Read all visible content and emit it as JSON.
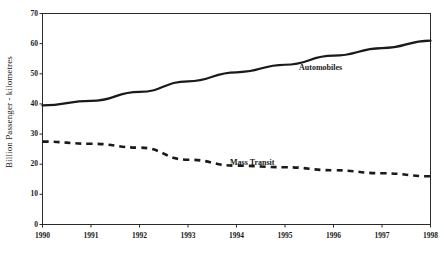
{
  "chart_data": {
    "type": "line",
    "title": "",
    "subtitle": "",
    "xlabel": "",
    "ylabel": "Billion Passenger - kilometres",
    "x": [
      1990,
      1991,
      1992,
      1993,
      1994,
      1995,
      1996,
      1997,
      1998
    ],
    "categories": [
      "1990",
      "1991",
      "1992",
      "1993",
      "1994",
      "1995",
      "1996",
      "1997",
      "1998"
    ],
    "xlim": [
      1990,
      1998
    ],
    "ylim": [
      0,
      70
    ],
    "yticks": [
      0,
      10,
      20,
      30,
      40,
      50,
      60,
      70
    ],
    "ytick_labels": [
      "0",
      "10",
      "20",
      "30",
      "40",
      "50",
      "60",
      "70"
    ],
    "grid": false,
    "legend_position": "inline-annotation",
    "series": [
      {
        "name": "Automobiles",
        "style": "solid",
        "color": "#1a1a1a",
        "values": [
          39.5,
          41.0,
          44.0,
          47.5,
          50.5,
          53.0,
          56.0,
          58.5,
          61.0
        ]
      },
      {
        "name": "Mass Transit",
        "style": "dashed",
        "color": "#1a1a1a",
        "values": [
          27.5,
          26.8,
          25.5,
          21.5,
          19.5,
          19.0,
          18.0,
          17.0,
          16.0
        ]
      }
    ],
    "annotations": [
      {
        "text": "Automobiles",
        "series": "Automobiles"
      },
      {
        "text": "Mass Transit",
        "series": "Mass Transit"
      }
    ]
  },
  "axis": {
    "y_title": "Billion Passenger - kilometres"
  }
}
